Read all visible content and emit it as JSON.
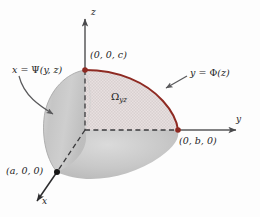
{
  "figure": {
    "background_color": "#fdfdfd"
  },
  "axes": {
    "z": {
      "label": "z",
      "color": "#58585a",
      "arrow_tip": [
        85,
        12
      ]
    },
    "y": {
      "label": "y",
      "color": "#58585a",
      "arrow_tip": [
        243,
        130
      ]
    },
    "x": {
      "label": "x",
      "color": "#3a3a3c",
      "arrow_tip": [
        31,
        203
      ]
    },
    "origin": [
      85,
      130
    ]
  },
  "points": [
    {
      "name": "point-c",
      "label": "(0, 0, c)",
      "coord": [
        85,
        70
      ],
      "color": "#8e2a22"
    },
    {
      "name": "point-b",
      "label": "(0, b, 0)",
      "coord": [
        178,
        130
      ],
      "color": "#8e2a22"
    },
    {
      "name": "point-a",
      "label": "(a, 0, 0)",
      "coord": [
        57,
        172
      ],
      "color": "#161616"
    }
  ],
  "labels": {
    "psi_prefix": "x = ",
    "psi_symbol": "Ψ",
    "psi_args": "(y, z)",
    "phi_prefix": "y = ",
    "phi_symbol": "Φ",
    "phi_args": "(z)",
    "omega_symbol": "Ω",
    "omega_subscript": "yz"
  },
  "colors": {
    "curve_red": "#8e2a22",
    "surface_gray": "#c9c9c9",
    "region_fill": "#ded6d6",
    "axis_gray": "#58585a",
    "dash_dark": "#3a3a3c",
    "leader_gray": "#5a5a5c"
  }
}
